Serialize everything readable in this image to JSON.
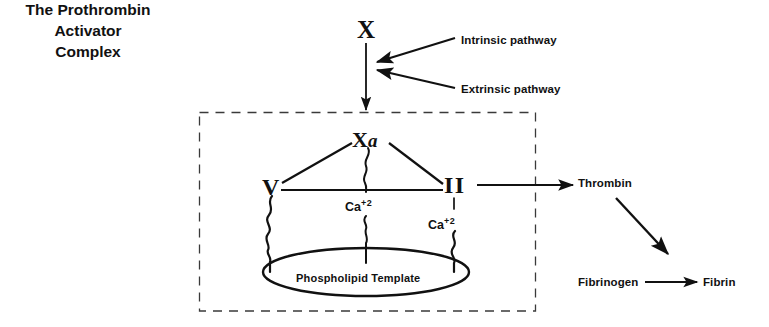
{
  "diagram": {
    "background_color": "#ffffff",
    "ink_color": "#111111",
    "complex_label": {
      "line1": "The Prothrombin",
      "line2": "Activator",
      "line3": "Complex",
      "full_text": "The Prothrombin Activator Complex"
    },
    "nodes": {
      "factor_x": "X",
      "factor_xa_main": "X",
      "factor_xa_sub": "a",
      "factor_xa_full": "X a",
      "factor_v": "V",
      "factor_ii": "II",
      "calcium_center": "Ca",
      "calcium_center_charge": "+2",
      "calcium_right": "Ca",
      "calcium_right_charge": "+2",
      "phospholipid_template": "Phospholipid Template",
      "thrombin": "Thrombin",
      "fibrinogen": "Fibrinogen",
      "fibrin": "Fibrin"
    },
    "pathways": {
      "intrinsic": "Intrinsic pathway",
      "extrinsic": "Extrinsic pathway"
    },
    "boundary": {
      "style": "dashed",
      "shape": "rectangle"
    }
  }
}
